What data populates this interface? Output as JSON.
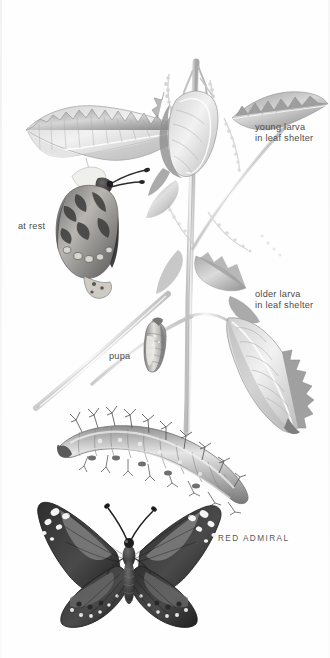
{
  "plate": {
    "title": "RED ADMIRAL",
    "subject": "Red Admiral butterfly life cycle on stinging nettle",
    "background_color": "#fefefe",
    "ink_color": "#4b4b4b",
    "width": 330,
    "height": 658
  },
  "labels": {
    "young_larva": "young larva\nin leaf shelter",
    "at_rest": "at rest",
    "older_larva": "older larva\nin leaf shelter",
    "pupa": "pupa",
    "species": "RED ADMIRAL"
  },
  "figures": [
    {
      "name": "nettle-plant",
      "caption": ""
    },
    {
      "name": "young-larva-leaf-shelter",
      "caption": "young larva\nin leaf shelter"
    },
    {
      "name": "adult-butterfly-at-rest",
      "caption": "at rest"
    },
    {
      "name": "older-larva-leaf-shelter",
      "caption": "older larva\nin leaf shelter"
    },
    {
      "name": "pupa-chrysalis",
      "caption": "pupa"
    },
    {
      "name": "mature-caterpillar",
      "caption": ""
    },
    {
      "name": "adult-butterfly-spread",
      "caption": "RED ADMIRAL"
    }
  ]
}
